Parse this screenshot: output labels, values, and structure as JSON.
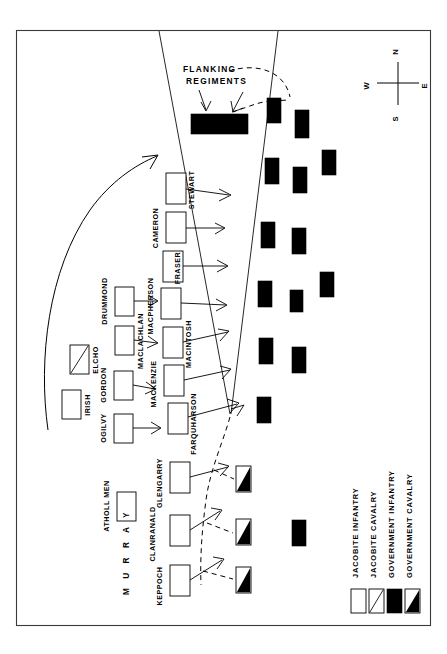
{
  "map": {
    "title": "Battle map of Jacobite and Government lines",
    "frame": {
      "x": 16,
      "y": 30,
      "width": 415,
      "height": 596
    },
    "colors": {
      "ink": "#000000",
      "paper": "#ffffff",
      "frame": "#3a3a3a"
    }
  },
  "compass": {
    "name": "compass-rose",
    "north": "N",
    "south": "S",
    "east": "E",
    "west": "W",
    "center": {
      "x": 398,
      "y": 83
    }
  },
  "annotations": {
    "flanking_line1": "FLANKING",
    "flanking_line2": "REGIMENTS"
  },
  "jacobite_front_line": [
    {
      "label": "STEWART",
      "x": 166,
      "y": 173,
      "w": 20,
      "h": 31
    },
    {
      "label": "CAMERON",
      "x": 166,
      "y": 212,
      "w": 20,
      "h": 31
    },
    {
      "label": "FRASER",
      "x": 163,
      "y": 251,
      "w": 20,
      "h": 31
    },
    {
      "label": "MACPHERSON",
      "x": 161,
      "y": 288,
      "w": 20,
      "h": 31
    },
    {
      "label": "MACINTOSH",
      "x": 163,
      "y": 327,
      "w": 20,
      "h": 31
    },
    {
      "label": "MACKENZIE",
      "x": 164,
      "y": 365,
      "w": 20,
      "h": 31
    },
    {
      "label": "FARQUHARSON",
      "x": 168,
      "y": 403,
      "w": 20,
      "h": 31
    },
    {
      "label": "GLENGARRY",
      "x": 170,
      "y": 462,
      "w": 20,
      "h": 31
    },
    {
      "label": "CLANRANALD",
      "x": 170,
      "y": 515,
      "w": 20,
      "h": 31
    },
    {
      "label": "KEPPOCH",
      "x": 170,
      "y": 565,
      "w": 20,
      "h": 31
    }
  ],
  "jacobite_second_line": [
    {
      "label": "DRUMMOND",
      "x": 115,
      "y": 287,
      "w": 19,
      "h": 29
    },
    {
      "label": "MACLACHLAN",
      "x": 115,
      "y": 326,
      "w": 19,
      "h": 29
    },
    {
      "label": "GORDON",
      "x": 114,
      "y": 371,
      "w": 19,
      "h": 29
    },
    {
      "label": "OGILVY",
      "x": 114,
      "y": 414,
      "w": 19,
      "h": 29
    }
  ],
  "jacobite_reserves": [
    {
      "label": "IRISH",
      "type": "infantry",
      "x": 62,
      "y": 390,
      "w": 19,
      "h": 29
    },
    {
      "label": "ELCHO",
      "type": "cavalry",
      "x": 70,
      "y": 345,
      "w": 19,
      "h": 29
    },
    {
      "label": "ATHOLL MEN",
      "type": "infantry",
      "x": 117,
      "y": 492,
      "w": 19,
      "h": 29
    }
  ],
  "commander_label": "M U R R A Y",
  "flanking_bar": {
    "x": 191,
    "y": 114,
    "w": 57,
    "h": 20
  },
  "government_infantry": [
    {
      "x": 267,
      "y": 98,
      "w": 14,
      "h": 25
    },
    {
      "x": 295,
      "y": 110,
      "w": 14,
      "h": 28
    },
    {
      "x": 265,
      "y": 158,
      "w": 14,
      "h": 26
    },
    {
      "x": 293,
      "y": 167,
      "w": 14,
      "h": 26
    },
    {
      "x": 322,
      "y": 150,
      "w": 14,
      "h": 25
    },
    {
      "x": 261,
      "y": 222,
      "w": 14,
      "h": 26
    },
    {
      "x": 292,
      "y": 228,
      "w": 14,
      "h": 26
    },
    {
      "x": 258,
      "y": 281,
      "w": 14,
      "h": 26
    },
    {
      "x": 290,
      "y": 290,
      "w": 13,
      "h": 22
    },
    {
      "x": 320,
      "y": 272,
      "w": 14,
      "h": 25
    },
    {
      "x": 259,
      "y": 338,
      "w": 14,
      "h": 26
    },
    {
      "x": 292,
      "y": 347,
      "w": 14,
      "h": 26
    },
    {
      "x": 257,
      "y": 397,
      "w": 14,
      "h": 26
    },
    {
      "x": 292,
      "y": 520,
      "w": 14,
      "h": 26
    }
  ],
  "government_cavalry": [
    {
      "x": 236,
      "y": 466,
      "w": 15,
      "h": 26
    },
    {
      "x": 236,
      "y": 519,
      "w": 15,
      "h": 26
    },
    {
      "x": 236,
      "y": 567,
      "w": 15,
      "h": 26
    }
  ],
  "legend": {
    "name": "map-legend",
    "entries": [
      {
        "label": "JACOBITE INFANTRY",
        "symbol": "white-box",
        "swatch_x": 351,
        "swatch_y": 589
      },
      {
        "label": "JACOBITE CAVALRY",
        "symbol": "diagonal-box",
        "swatch_x": 368,
        "swatch_y": 589
      },
      {
        "label": "GOVERNMENT INFANTRY",
        "symbol": "black-box",
        "swatch_x": 387,
        "swatch_y": 589
      },
      {
        "label": "GOVERNMENT CAVALRY",
        "symbol": "half-black-box",
        "swatch_x": 405,
        "swatch_y": 589
      }
    ]
  }
}
